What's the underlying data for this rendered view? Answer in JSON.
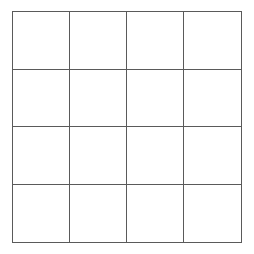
{
  "board": {
    "rows": 4,
    "cols": 4,
    "line_color": "#5a5a5a",
    "background": "#ffffff",
    "cells": [
      [
        "",
        "",
        "",
        ""
      ],
      [
        "",
        "",
        "",
        ""
      ],
      [
        "",
        "",
        "",
        ""
      ],
      [
        "",
        "",
        "",
        ""
      ]
    ]
  }
}
